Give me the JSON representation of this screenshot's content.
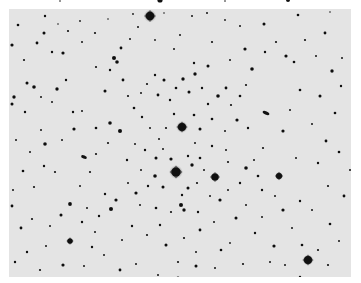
{
  "image": {
    "description": "Negative (inverted) astronomical photograph of an open star cluster field: dark stars on a light grey background",
    "background_color": "#e4e4e4",
    "border_color": "#ffffff",
    "star_color": "#111111",
    "plate": {
      "x": 9,
      "y": 9,
      "width": 342,
      "height": 268
    }
  },
  "top_strip_stars": [
    {
      "x": 160,
      "y": 0,
      "r": 2.6
    },
    {
      "x": 288,
      "y": 0,
      "r": 2.0
    },
    {
      "x": 60,
      "y": 1,
      "r": 0.8
    },
    {
      "x": 225,
      "y": 1,
      "r": 0.8
    }
  ],
  "bright_stars": [
    {
      "x": 150,
      "y": 16,
      "r": 4.2,
      "halo": 6.5
    },
    {
      "x": 182,
      "y": 127,
      "r": 4.0,
      "halo": 6.0
    },
    {
      "x": 176,
      "y": 172,
      "r": 4.6,
      "halo": 7.0
    },
    {
      "x": 215,
      "y": 177,
      "r": 3.6,
      "halo": 5.0
    },
    {
      "x": 308,
      "y": 260,
      "r": 4.0,
      "halo": 5.5
    },
    {
      "x": 279,
      "y": 176,
      "r": 3.0,
      "halo": 4.2
    },
    {
      "x": 70,
      "y": 241,
      "r": 2.6,
      "halo": 3.5
    }
  ],
  "galaxies": [
    {
      "x": 266,
      "y": 113,
      "rx": 3.6,
      "ry": 1.6,
      "rot": 25
    },
    {
      "x": 84,
      "y": 157,
      "rx": 3.0,
      "ry": 1.6,
      "rot": 20
    }
  ],
  "stars": [
    {
      "x": 45,
      "y": 16,
      "r": 1.2
    },
    {
      "x": 58,
      "y": 24,
      "r": 0.8
    },
    {
      "x": 18,
      "y": 25,
      "r": 1.3
    },
    {
      "x": 80,
      "y": 21,
      "r": 0.9
    },
    {
      "x": 108,
      "y": 19,
      "r": 0.8
    },
    {
      "x": 133,
      "y": 14,
      "r": 0.9
    },
    {
      "x": 138,
      "y": 27,
      "r": 1.0
    },
    {
      "x": 164,
      "y": 13,
      "r": 0.8
    },
    {
      "x": 192,
      "y": 16,
      "r": 1.0
    },
    {
      "x": 207,
      "y": 13,
      "r": 1.0
    },
    {
      "x": 225,
      "y": 20,
      "r": 0.9
    },
    {
      "x": 240,
      "y": 26,
      "r": 1.0
    },
    {
      "x": 264,
      "y": 24,
      "r": 1.5
    },
    {
      "x": 298,
      "y": 15,
      "r": 1.3
    },
    {
      "x": 330,
      "y": 12,
      "r": 0.8
    },
    {
      "x": 325,
      "y": 33,
      "r": 1.4
    },
    {
      "x": 305,
      "y": 40,
      "r": 1.1
    },
    {
      "x": 44,
      "y": 33,
      "r": 1.5
    },
    {
      "x": 68,
      "y": 31,
      "r": 1.1
    },
    {
      "x": 37,
      "y": 43,
      "r": 1.4
    },
    {
      "x": 12,
      "y": 45,
      "r": 1.6
    },
    {
      "x": 52,
      "y": 52,
      "r": 1.2
    },
    {
      "x": 63,
      "y": 53,
      "r": 1.6
    },
    {
      "x": 114,
      "y": 58,
      "r": 2.0
    },
    {
      "x": 121,
      "y": 48,
      "r": 1.4
    },
    {
      "x": 155,
      "y": 40,
      "r": 0.9
    },
    {
      "x": 174,
      "y": 49,
      "r": 1.0
    },
    {
      "x": 194,
      "y": 63,
      "r": 1.2
    },
    {
      "x": 208,
      "y": 66,
      "r": 1.5
    },
    {
      "x": 245,
      "y": 49,
      "r": 1.6
    },
    {
      "x": 252,
      "y": 69,
      "r": 1.8
    },
    {
      "x": 265,
      "y": 52,
      "r": 1.2
    },
    {
      "x": 276,
      "y": 42,
      "r": 1.1
    },
    {
      "x": 286,
      "y": 56,
      "r": 1.6
    },
    {
      "x": 294,
      "y": 62,
      "r": 1.3
    },
    {
      "x": 332,
      "y": 71,
      "r": 1.7
    },
    {
      "x": 341,
      "y": 86,
      "r": 1.2
    },
    {
      "x": 320,
      "y": 96,
      "r": 1.5
    },
    {
      "x": 335,
      "y": 113,
      "r": 1.3
    },
    {
      "x": 312,
      "y": 124,
      "r": 1.0
    },
    {
      "x": 300,
      "y": 90,
      "r": 1.3
    },
    {
      "x": 290,
      "y": 110,
      "r": 1.0
    },
    {
      "x": 283,
      "y": 131,
      "r": 1.6
    },
    {
      "x": 263,
      "y": 148,
      "r": 1.1
    },
    {
      "x": 296,
      "y": 158,
      "r": 1.0
    },
    {
      "x": 326,
      "y": 141,
      "r": 1.4
    },
    {
      "x": 339,
      "y": 152,
      "r": 1.3
    },
    {
      "x": 318,
      "y": 163,
      "r": 1.2
    },
    {
      "x": 328,
      "y": 186,
      "r": 1.1
    },
    {
      "x": 344,
      "y": 196,
      "r": 1.4
    },
    {
      "x": 300,
      "y": 201,
      "r": 1.2
    },
    {
      "x": 283,
      "y": 210,
      "r": 1.6
    },
    {
      "x": 275,
      "y": 196,
      "r": 1.0
    },
    {
      "x": 262,
      "y": 217,
      "r": 1.0
    },
    {
      "x": 255,
      "y": 233,
      "r": 1.2
    },
    {
      "x": 274,
      "y": 246,
      "r": 1.6
    },
    {
      "x": 302,
      "y": 245,
      "r": 1.3
    },
    {
      "x": 330,
      "y": 224,
      "r": 1.3
    },
    {
      "x": 339,
      "y": 241,
      "r": 1.0
    },
    {
      "x": 328,
      "y": 265,
      "r": 1.1
    },
    {
      "x": 300,
      "y": 277,
      "r": 1.2
    },
    {
      "x": 285,
      "y": 265,
      "r": 1.0
    },
    {
      "x": 243,
      "y": 264,
      "r": 1.1
    },
    {
      "x": 230,
      "y": 243,
      "r": 0.9
    },
    {
      "x": 215,
      "y": 268,
      "r": 1.0
    },
    {
      "x": 196,
      "y": 266,
      "r": 1.5
    },
    {
      "x": 178,
      "y": 278,
      "r": 1.4
    },
    {
      "x": 158,
      "y": 275,
      "r": 1.0
    },
    {
      "x": 136,
      "y": 264,
      "r": 1.0
    },
    {
      "x": 120,
      "y": 270,
      "r": 1.4
    },
    {
      "x": 104,
      "y": 255,
      "r": 1.0
    },
    {
      "x": 92,
      "y": 247,
      "r": 1.2
    },
    {
      "x": 63,
      "y": 265,
      "r": 1.6
    },
    {
      "x": 40,
      "y": 270,
      "r": 1.1
    },
    {
      "x": 27,
      "y": 252,
      "r": 1.2
    },
    {
      "x": 21,
      "y": 228,
      "r": 1.4
    },
    {
      "x": 32,
      "y": 219,
      "r": 1.1
    },
    {
      "x": 50,
      "y": 226,
      "r": 1.0
    },
    {
      "x": 61,
      "y": 215,
      "r": 1.5
    },
    {
      "x": 70,
      "y": 204,
      "r": 1.9
    },
    {
      "x": 87,
      "y": 208,
      "r": 1.0
    },
    {
      "x": 99,
      "y": 216,
      "r": 1.2
    },
    {
      "x": 111,
      "y": 209,
      "r": 2.0
    },
    {
      "x": 116,
      "y": 200,
      "r": 1.6
    },
    {
      "x": 105,
      "y": 194,
      "r": 1.2
    },
    {
      "x": 12,
      "y": 206,
      "r": 1.4
    },
    {
      "x": 13,
      "y": 190,
      "r": 1.0
    },
    {
      "x": 23,
      "y": 171,
      "r": 1.3
    },
    {
      "x": 44,
      "y": 166,
      "r": 1.2
    },
    {
      "x": 34,
      "y": 187,
      "r": 1.1
    },
    {
      "x": 55,
      "y": 172,
      "r": 1.1
    },
    {
      "x": 45,
      "y": 144,
      "r": 1.8
    },
    {
      "x": 41,
      "y": 130,
      "r": 1.0
    },
    {
      "x": 74,
      "y": 129,
      "r": 1.6
    },
    {
      "x": 96,
      "y": 128,
      "r": 1.3
    },
    {
      "x": 110,
      "y": 123,
      "r": 1.8
    },
    {
      "x": 120,
      "y": 131,
      "r": 2.0
    },
    {
      "x": 108,
      "y": 143,
      "r": 1.1
    },
    {
      "x": 90,
      "y": 172,
      "r": 1.1
    },
    {
      "x": 14,
      "y": 97,
      "r": 1.7
    },
    {
      "x": 12,
      "y": 104,
      "r": 1.5
    },
    {
      "x": 25,
      "y": 112,
      "r": 1.2
    },
    {
      "x": 27,
      "y": 83,
      "r": 1.5
    },
    {
      "x": 34,
      "y": 87,
      "r": 1.8
    },
    {
      "x": 41,
      "y": 97,
      "r": 1.0
    },
    {
      "x": 57,
      "y": 89,
      "r": 1.7
    },
    {
      "x": 66,
      "y": 80,
      "r": 1.2
    },
    {
      "x": 52,
      "y": 102,
      "r": 1.0
    },
    {
      "x": 73,
      "y": 112,
      "r": 1.2
    },
    {
      "x": 82,
      "y": 111,
      "r": 1.0
    },
    {
      "x": 105,
      "y": 91,
      "r": 1.5
    },
    {
      "x": 110,
      "y": 70,
      "r": 1.2
    },
    {
      "x": 117,
      "y": 62,
      "r": 1.8
    },
    {
      "x": 123,
      "y": 80,
      "r": 1.4
    },
    {
      "x": 128,
      "y": 96,
      "r": 1.1
    },
    {
      "x": 134,
      "y": 108,
      "r": 1.3
    },
    {
      "x": 141,
      "y": 93,
      "r": 1.0
    },
    {
      "x": 147,
      "y": 84,
      "r": 1.1
    },
    {
      "x": 155,
      "y": 75,
      "r": 1.2
    },
    {
      "x": 158,
      "y": 95,
      "r": 1.4
    },
    {
      "x": 164,
      "y": 80,
      "r": 1.5
    },
    {
      "x": 170,
      "y": 100,
      "r": 1.2
    },
    {
      "x": 176,
      "y": 88,
      "r": 1.3
    },
    {
      "x": 183,
      "y": 79,
      "r": 1.7
    },
    {
      "x": 189,
      "y": 92,
      "r": 1.5
    },
    {
      "x": 195,
      "y": 74,
      "r": 1.7
    },
    {
      "x": 202,
      "y": 88,
      "r": 1.2
    },
    {
      "x": 208,
      "y": 104,
      "r": 1.2
    },
    {
      "x": 218,
      "y": 96,
      "r": 1.8
    },
    {
      "x": 226,
      "y": 88,
      "r": 1.4
    },
    {
      "x": 231,
      "y": 105,
      "r": 1.1
    },
    {
      "x": 240,
      "y": 96,
      "r": 1.3
    },
    {
      "x": 246,
      "y": 85,
      "r": 1.1
    },
    {
      "x": 237,
      "y": 120,
      "r": 1.6
    },
    {
      "x": 248,
      "y": 128,
      "r": 1.2
    },
    {
      "x": 225,
      "y": 131,
      "r": 1.0
    },
    {
      "x": 212,
      "y": 119,
      "r": 1.3
    },
    {
      "x": 200,
      "y": 129,
      "r": 1.5
    },
    {
      "x": 194,
      "y": 115,
      "r": 1.3
    },
    {
      "x": 174,
      "y": 114,
      "r": 1.2
    },
    {
      "x": 166,
      "y": 128,
      "r": 1.1
    },
    {
      "x": 159,
      "y": 139,
      "r": 1.0
    },
    {
      "x": 150,
      "y": 128,
      "r": 1.0
    },
    {
      "x": 142,
      "y": 117,
      "r": 1.2
    },
    {
      "x": 135,
      "y": 144,
      "r": 1.0
    },
    {
      "x": 145,
      "y": 150,
      "r": 1.2
    },
    {
      "x": 156,
      "y": 158,
      "r": 1.5
    },
    {
      "x": 163,
      "y": 149,
      "r": 1.0
    },
    {
      "x": 171,
      "y": 159,
      "r": 1.6
    },
    {
      "x": 188,
      "y": 156,
      "r": 1.2
    },
    {
      "x": 192,
      "y": 165,
      "r": 1.7
    },
    {
      "x": 200,
      "y": 158,
      "r": 1.3
    },
    {
      "x": 204,
      "y": 170,
      "r": 1.0
    },
    {
      "x": 197,
      "y": 183,
      "r": 1.1
    },
    {
      "x": 188,
      "y": 188,
      "r": 1.5
    },
    {
      "x": 182,
      "y": 195,
      "r": 1.2
    },
    {
      "x": 163,
      "y": 187,
      "r": 1.5
    },
    {
      "x": 155,
      "y": 176,
      "r": 1.8
    },
    {
      "x": 148,
      "y": 186,
      "r": 1.2
    },
    {
      "x": 141,
      "y": 170,
      "r": 1.0
    },
    {
      "x": 136,
      "y": 193,
      "r": 1.6
    },
    {
      "x": 128,
      "y": 183,
      "r": 1.0
    },
    {
      "x": 127,
      "y": 160,
      "r": 1.2
    },
    {
      "x": 140,
      "y": 205,
      "r": 1.0
    },
    {
      "x": 156,
      "y": 208,
      "r": 1.3
    },
    {
      "x": 171,
      "y": 212,
      "r": 1.1
    },
    {
      "x": 181,
      "y": 205,
      "r": 2.0
    },
    {
      "x": 184,
      "y": 210,
      "r": 1.7
    },
    {
      "x": 198,
      "y": 212,
      "r": 1.2
    },
    {
      "x": 210,
      "y": 196,
      "r": 1.0
    },
    {
      "x": 220,
      "y": 200,
      "r": 1.6
    },
    {
      "x": 228,
      "y": 190,
      "r": 1.0
    },
    {
      "x": 236,
      "y": 218,
      "r": 1.5
    },
    {
      "x": 246,
      "y": 205,
      "r": 1.0
    },
    {
      "x": 240,
      "y": 183,
      "r": 1.2
    },
    {
      "x": 246,
      "y": 168,
      "r": 1.8
    },
    {
      "x": 254,
      "y": 160,
      "r": 1.0
    },
    {
      "x": 258,
      "y": 176,
      "r": 1.3
    },
    {
      "x": 262,
      "y": 190,
      "r": 1.2
    },
    {
      "x": 228,
      "y": 162,
      "r": 1.1
    },
    {
      "x": 226,
      "y": 150,
      "r": 1.0
    },
    {
      "x": 212,
      "y": 146,
      "r": 1.2
    },
    {
      "x": 195,
      "y": 143,
      "r": 1.0
    },
    {
      "x": 160,
      "y": 225,
      "r": 1.2
    },
    {
      "x": 147,
      "y": 235,
      "r": 1.1
    },
    {
      "x": 132,
      "y": 226,
      "r": 1.2
    },
    {
      "x": 122,
      "y": 240,
      "r": 1.0
    },
    {
      "x": 166,
      "y": 245,
      "r": 1.5
    },
    {
      "x": 184,
      "y": 238,
      "r": 1.1
    },
    {
      "x": 200,
      "y": 230,
      "r": 1.4
    },
    {
      "x": 214,
      "y": 222,
      "r": 1.0
    },
    {
      "x": 221,
      "y": 250,
      "r": 1.3
    },
    {
      "x": 196,
      "y": 252,
      "r": 1.0
    },
    {
      "x": 178,
      "y": 262,
      "r": 1.1
    },
    {
      "x": 95,
      "y": 232,
      "r": 1.0
    },
    {
      "x": 82,
      "y": 222,
      "r": 1.2
    },
    {
      "x": 84,
      "y": 266,
      "r": 1.0
    },
    {
      "x": 46,
      "y": 246,
      "r": 1.0
    },
    {
      "x": 15,
      "y": 262,
      "r": 1.2
    },
    {
      "x": 16,
      "y": 140,
      "r": 1.0
    },
    {
      "x": 30,
      "y": 152,
      "r": 1.0
    },
    {
      "x": 62,
      "y": 140,
      "r": 1.0
    },
    {
      "x": 96,
      "y": 154,
      "r": 1.1
    },
    {
      "x": 80,
      "y": 186,
      "r": 1.0
    },
    {
      "x": 24,
      "y": 60,
      "r": 1.1
    },
    {
      "x": 82,
      "y": 42,
      "r": 1.0
    },
    {
      "x": 95,
      "y": 33,
      "r": 1.1
    },
    {
      "x": 96,
      "y": 67,
      "r": 1.1
    },
    {
      "x": 130,
      "y": 39,
      "r": 1.0
    },
    {
      "x": 180,
      "y": 35,
      "r": 1.0
    },
    {
      "x": 212,
      "y": 42,
      "r": 1.1
    },
    {
      "x": 230,
      "y": 60,
      "r": 1.0
    },
    {
      "x": 316,
      "y": 56,
      "r": 1.0
    },
    {
      "x": 342,
      "y": 58,
      "r": 1.0
    },
    {
      "x": 350,
      "y": 170,
      "r": 1.0
    },
    {
      "x": 312,
      "y": 210,
      "r": 1.0
    },
    {
      "x": 292,
      "y": 228,
      "r": 1.0
    },
    {
      "x": 318,
      "y": 250,
      "r": 1.1
    },
    {
      "x": 270,
      "y": 262,
      "r": 1.0
    }
  ]
}
